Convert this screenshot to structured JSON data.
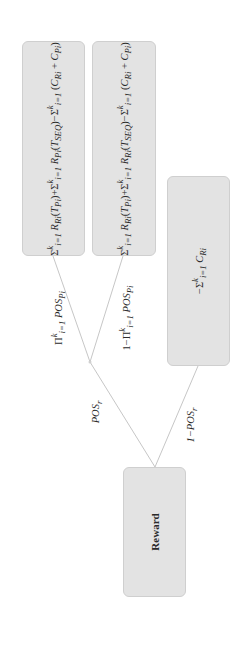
{
  "diagram": {
    "type": "decision-tree",
    "orientation": "rotated -90deg (root at bottom)",
    "root": {
      "label": "Reward"
    },
    "junction": {
      "label": ""
    },
    "edges": [
      {
        "from": "root",
        "to": "junction",
        "label": "POS_r"
      },
      {
        "from": "root",
        "to": "leaf_fail_r",
        "label": "1−POS_r"
      },
      {
        "from": "junction",
        "to": "leaf_all_pass",
        "label": "Π_{i=1}^{k} POS_{Pi}"
      },
      {
        "from": "junction",
        "to": "leaf_partial",
        "label": "1−Π_{i=1}^{k} POS_{Pi}"
      }
    ],
    "leaves": {
      "leaf_all_pass": {
        "formula": "Σ_{i=1}^{k} R_{Ri}(T_{Pi}) + Σ_{i=1}^{k} R_{Pi}(T_{SEQ}) − Σ_{i=1}^{k} (C_{Ri} + C_{Pi})"
      },
      "leaf_partial": {
        "formula": "Σ_{i=1}^{k} R_{Ri}(T_{Pi}) + Σ_{i=1}^{k} R_{Ri}(T_{SEQ}) − Σ_{i=1}^{k} (C_{Ri} + C_{Pi})"
      },
      "leaf_fail_r": {
        "formula": "−Σ_{i=1}^{k} C_{Ri}"
      }
    },
    "display": {
      "reward": "Reward",
      "edge_pos_r": "POS",
      "edge_pos_r_sub": "r",
      "edge_not_pos_r_prefix": "1−POS",
      "edge_not_pos_r_sub": "r",
      "edge_all_prefix": "Π",
      "edge_partial_prefix": "1−Π",
      "edge_sup": "k",
      "edge_sub": "i=1",
      "edge_pos": "POS",
      "edge_pos_sub": "Pi",
      "sigma": "Σ",
      "sup_k": "k",
      "sub_i1": "i=1",
      "minus": "−",
      "plus": "+",
      "R": "R",
      "C": "C",
      "T": "T",
      "Ri": "Ri",
      "Pi": "Pi",
      "SEQ": "SEQ",
      "open": "(",
      "close": ")"
    },
    "colors": {
      "node_fill": "#e3e3e3",
      "node_border": "#cfcfcf",
      "edge": "#b8b8b8",
      "text": "#2a2a2a"
    }
  }
}
